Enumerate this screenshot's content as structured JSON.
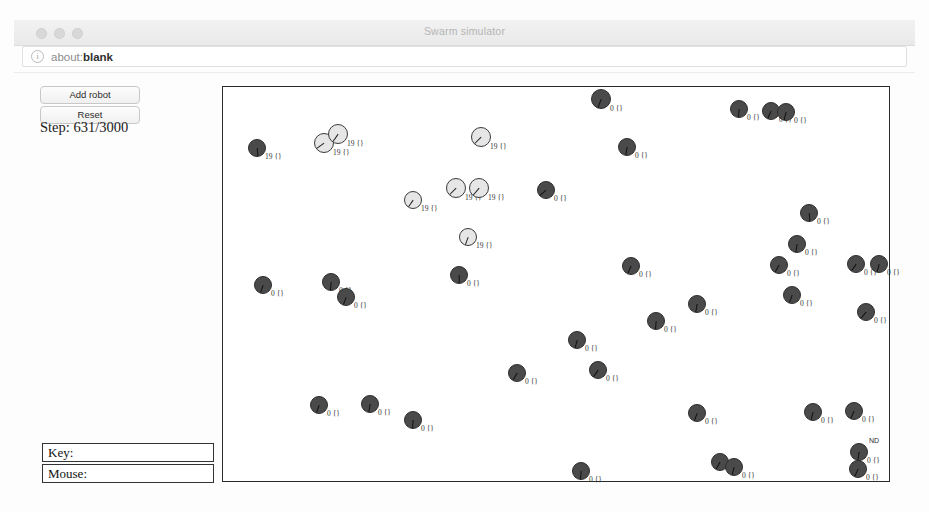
{
  "window": {
    "title": "Swarm simulator",
    "traffic_lights": [
      "close-button",
      "minimize-button",
      "zoom-button"
    ]
  },
  "address_bar": {
    "info_icon": "info-icon",
    "scheme": "about:",
    "value": "blank",
    "full_value": "about:blank"
  },
  "controls": {
    "add_robot_label": "Add robot",
    "reset_label": "Reset",
    "step_text": "Step: 631/3000",
    "step_current": 631,
    "step_total": 3000
  },
  "fields": [
    {
      "name": "key-field",
      "label": "Key:",
      "value": ""
    },
    {
      "name": "mouse-field",
      "label": "Mouse:",
      "value": ""
    }
  ],
  "canvas": {
    "border_color": "#2a2a2a",
    "background": "#ffffff",
    "annotation": "ND",
    "annotation_x": 868,
    "annotation_y": 436,
    "robot_colors": {
      "dark_fill": "#4a4a4a",
      "light_fill": "#e6e6e6",
      "stroke": "#2e2e2e"
    },
    "robots": [
      {
        "x": 256,
        "y": 147,
        "r": 9,
        "type": "dark",
        "heading": 175,
        "label": "19 {}"
      },
      {
        "x": 323,
        "y": 142,
        "r": 10,
        "type": "light",
        "heading": 235,
        "label": "19 {}"
      },
      {
        "x": 337,
        "y": 133,
        "r": 10,
        "type": "light",
        "heading": 215,
        "label": "19 {}"
      },
      {
        "x": 480,
        "y": 136,
        "r": 10,
        "type": "light",
        "heading": 225,
        "label": "19 {}"
      },
      {
        "x": 600,
        "y": 98,
        "r": 10,
        "type": "dark",
        "heading": 200,
        "label": "0 {}"
      },
      {
        "x": 626,
        "y": 146,
        "r": 9,
        "type": "dark",
        "heading": 190,
        "label": "0 {}"
      },
      {
        "x": 738,
        "y": 108,
        "r": 9,
        "type": "dark",
        "heading": 185,
        "label": "0 {}"
      },
      {
        "x": 770,
        "y": 110,
        "r": 9,
        "type": "dark",
        "heading": 205,
        "label": "0 {}"
      },
      {
        "x": 785,
        "y": 111,
        "r": 9,
        "type": "dark",
        "heading": 195,
        "label": "0 {}"
      },
      {
        "x": 412,
        "y": 199,
        "r": 9,
        "type": "light",
        "heading": 215,
        "label": "19 {}"
      },
      {
        "x": 455,
        "y": 187,
        "r": 10,
        "type": "light",
        "heading": 225,
        "label": "19 {}"
      },
      {
        "x": 478,
        "y": 187,
        "r": 10,
        "type": "light",
        "heading": 220,
        "label": "19 {}"
      },
      {
        "x": 545,
        "y": 189,
        "r": 9,
        "type": "dark",
        "heading": 230,
        "label": "0 {}"
      },
      {
        "x": 808,
        "y": 212,
        "r": 9,
        "type": "dark",
        "heading": 175,
        "label": "0 {}"
      },
      {
        "x": 467,
        "y": 236,
        "r": 9,
        "type": "light",
        "heading": 200,
        "label": "19 {}"
      },
      {
        "x": 796,
        "y": 243,
        "r": 9,
        "type": "dark",
        "heading": 190,
        "label": "0 {}"
      },
      {
        "x": 262,
        "y": 284,
        "r": 9,
        "type": "dark",
        "heading": 200,
        "label": "0 {}"
      },
      {
        "x": 330,
        "y": 281,
        "r": 9,
        "type": "dark",
        "heading": 185,
        "label": "0 {}"
      },
      {
        "x": 345,
        "y": 296,
        "r": 9,
        "type": "dark",
        "heading": 200,
        "label": "0 {}"
      },
      {
        "x": 458,
        "y": 274,
        "r": 9,
        "type": "dark",
        "heading": 180,
        "label": "0 {}"
      },
      {
        "x": 630,
        "y": 265,
        "r": 9,
        "type": "dark",
        "heading": 205,
        "label": "0 {}"
      },
      {
        "x": 778,
        "y": 264,
        "r": 9,
        "type": "dark",
        "heading": 210,
        "label": "0 {}"
      },
      {
        "x": 855,
        "y": 263,
        "r": 9,
        "type": "dark",
        "heading": 215,
        "label": "0 {}"
      },
      {
        "x": 878,
        "y": 263,
        "r": 9,
        "type": "dark",
        "heading": 195,
        "label": "0 {}"
      },
      {
        "x": 696,
        "y": 303,
        "r": 9,
        "type": "dark",
        "heading": 190,
        "label": "0 {}"
      },
      {
        "x": 791,
        "y": 294,
        "r": 9,
        "type": "dark",
        "heading": 200,
        "label": "0 {}"
      },
      {
        "x": 655,
        "y": 320,
        "r": 9,
        "type": "dark",
        "heading": 185,
        "label": "0 {}"
      },
      {
        "x": 865,
        "y": 311,
        "r": 9,
        "type": "dark",
        "heading": 220,
        "label": "0 {}"
      },
      {
        "x": 576,
        "y": 339,
        "r": 9,
        "type": "dark",
        "heading": 195,
        "label": "0 {}"
      },
      {
        "x": 516,
        "y": 372,
        "r": 9,
        "type": "dark",
        "heading": 210,
        "label": "0 {}"
      },
      {
        "x": 597,
        "y": 369,
        "r": 9,
        "type": "dark",
        "heading": 215,
        "label": "0 {}"
      },
      {
        "x": 318,
        "y": 404,
        "r": 9,
        "type": "dark",
        "heading": 200,
        "label": "0 {}"
      },
      {
        "x": 369,
        "y": 403,
        "r": 9,
        "type": "dark",
        "heading": 190,
        "label": "0 {}"
      },
      {
        "x": 412,
        "y": 419,
        "r": 9,
        "type": "dark",
        "heading": 185,
        "label": "0 {}"
      },
      {
        "x": 696,
        "y": 412,
        "r": 9,
        "type": "dark",
        "heading": 200,
        "label": "0 {}"
      },
      {
        "x": 812,
        "y": 411,
        "r": 9,
        "type": "dark",
        "heading": 195,
        "label": "0 {}"
      },
      {
        "x": 853,
        "y": 410,
        "r": 9,
        "type": "dark",
        "heading": 205,
        "label": "0 {}"
      },
      {
        "x": 858,
        "y": 451,
        "r": 9,
        "type": "dark",
        "heading": 190,
        "label": "0 {}"
      },
      {
        "x": 857,
        "y": 468,
        "r": 9,
        "type": "dark",
        "heading": 205,
        "label": "0 {}"
      },
      {
        "x": 719,
        "y": 461,
        "r": 9,
        "type": "dark",
        "heading": 210,
        "label": "0 {}"
      },
      {
        "x": 733,
        "y": 466,
        "r": 9,
        "type": "dark",
        "heading": 195,
        "label": "0 {}"
      },
      {
        "x": 580,
        "y": 470,
        "r": 9,
        "type": "dark",
        "heading": 185,
        "label": "0 {}"
      }
    ]
  }
}
